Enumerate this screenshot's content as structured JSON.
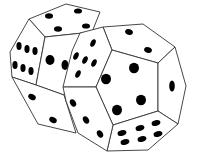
{
  "image": {
    "subject": "two white dodecahedral dice with black pips",
    "background": "#ffffff",
    "colors": {
      "die_body": "#ffffff",
      "edge": "#333333",
      "pip": "#000000"
    }
  },
  "dice": [
    {
      "name": "back-die",
      "position": "left-rear",
      "visible_faces": [
        {
          "name": "top",
          "pips": 4
        },
        {
          "name": "left",
          "pips": 6
        },
        {
          "name": "lower-left",
          "pips": 2
        },
        {
          "name": "front-center",
          "pips": 2
        }
      ]
    },
    {
      "name": "front-die",
      "position": "right-front",
      "visible_faces": [
        {
          "name": "top",
          "pips": 2
        },
        {
          "name": "left-upper",
          "pips": 5
        },
        {
          "name": "center",
          "pips": 4
        },
        {
          "name": "right",
          "pips": 1
        },
        {
          "name": "bottom",
          "pips": 6
        },
        {
          "name": "lower-left",
          "pips": 3
        }
      ]
    }
  ]
}
